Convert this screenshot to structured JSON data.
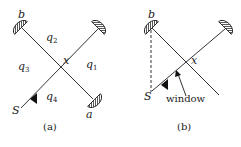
{
  "panel_a": {
    "caption": "(a)",
    "labels": {
      "b": "b",
      "a": "a",
      "S": "S",
      "x": "x",
      "q1": "q",
      "q1_sub": "1",
      "q2": "q",
      "q2_sub": "2",
      "q3": "q",
      "q3_sub": "3",
      "q4": "q",
      "q4_sub": "4"
    }
  },
  "panel_b": {
    "caption": "(b)",
    "labels": {
      "b": "b",
      "S": "S",
      "x": "x",
      "window": "window"
    }
  },
  "colors": {
    "line": "#333333",
    "text": "#222222",
    "background": "#ffffff"
  }
}
